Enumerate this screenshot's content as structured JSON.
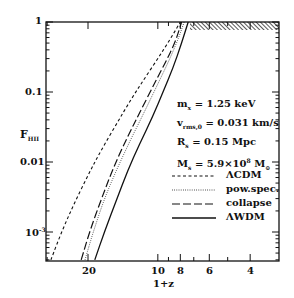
{
  "chart_data": {
    "type": "line",
    "title": "",
    "xlabel": "1+z",
    "ylabel": "F_HII",
    "xscale": "log",
    "yscale": "log",
    "x_reversed": true,
    "xlim": [
      30,
      3
    ],
    "ylim": [
      0.0004,
      1
    ],
    "x_ticks": [
      20,
      10,
      8,
      6,
      4
    ],
    "x_tick_labels": [
      "20",
      "10",
      "8",
      "6",
      "4"
    ],
    "y_ticks": [
      1,
      0.1,
      0.01,
      0.001
    ],
    "y_tick_labels": [
      "1",
      "0.1",
      "0.01",
      "10⁻³"
    ],
    "grid": false,
    "legend_position": "inside right",
    "hatched_region": {
      "x_from": 7.3,
      "x_to": 3,
      "y_at": 1,
      "description": "hatched band at F=1 after reionization"
    },
    "annotations": [
      "m_x = 1.25 keV",
      "v_rms,0 = 0.031 km/s",
      "R_s = 0.15 Mpc",
      "M_s = 5.9×10⁸ M_⊙"
    ],
    "series": [
      {
        "name": "ΛCDM",
        "style": "short-dash",
        "x": [
          28.9,
          26.0,
          23.0,
          20.0,
          17.5,
          15.0,
          13.0,
          11.5,
          10.0,
          8.9,
          8.0
        ],
        "y": [
          0.0004,
          0.001,
          0.0025,
          0.0065,
          0.015,
          0.036,
          0.08,
          0.15,
          0.3,
          0.55,
          1.0
        ]
      },
      {
        "name": "pow.spec.",
        "style": "dotted",
        "x": [
          20.6,
          19.0,
          17.0,
          15.0,
          13.0,
          11.5,
          10.0,
          9.0,
          8.2,
          7.7
        ],
        "y": [
          0.0004,
          0.001,
          0.003,
          0.008,
          0.022,
          0.05,
          0.13,
          0.27,
          0.55,
          1.0
        ]
      },
      {
        "name": "collapse",
        "style": "long-dash",
        "x": [
          21.4,
          19.7,
          17.5,
          15.5,
          13.5,
          12.0,
          10.5,
          9.3,
          8.4,
          7.9
        ],
        "y": [
          0.0004,
          0.001,
          0.003,
          0.0085,
          0.023,
          0.05,
          0.12,
          0.26,
          0.52,
          1.0
        ]
      },
      {
        "name": "ΛWDM",
        "style": "solid",
        "x": [
          18.7,
          17.0,
          15.0,
          13.5,
          12.0,
          10.5,
          9.5,
          8.6,
          7.9,
          7.4
        ],
        "y": [
          0.0004,
          0.001,
          0.003,
          0.0075,
          0.018,
          0.045,
          0.1,
          0.22,
          0.5,
          1.0
        ]
      }
    ]
  },
  "labels": {
    "ylabel_main": "F",
    "ylabel_sub": "HII",
    "xlabel": "1+z",
    "ytick_1": "1",
    "ytick_01": "0.1",
    "ytick_001": "0.01",
    "ytick_1e3_base": "10",
    "ytick_1e3_exp": "-3",
    "xtick_20": "20",
    "xtick_10": "10",
    "xtick_8": "8",
    "xtick_6": "6",
    "xtick_4": "4"
  },
  "annot": {
    "line1_a": "m",
    "line1_sub": "x",
    "line1_b": " = 1.25 keV",
    "line2_a": "v",
    "line2_sub": "rms,0",
    "line2_b": " = 0.031 km/s",
    "line3_a": "R",
    "line3_sub": "s",
    "line3_b": " = 0.15 Mpc",
    "line4_a": "M",
    "line4_sub": "s",
    "line4_b": " = 5.9×10",
    "line4_sup": "8",
    "line4_c": " M",
    "line4_sub2": "⊙"
  },
  "legend": {
    "lcdm": "ΛCDM",
    "powspec": "pow.spec.",
    "collapse": "collapse",
    "lwdm": "ΛWDM"
  }
}
